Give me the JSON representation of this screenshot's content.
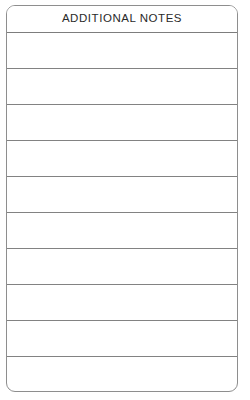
{
  "document": {
    "type": "form-section",
    "background_color": "#ffffff",
    "border_color": "#8e8e8e",
    "rule_color": "#828282",
    "text_color": "#2a2a2a"
  },
  "header": {
    "title": "ADDITIONAL NOTES"
  },
  "body": {
    "row_count": 10,
    "rows": [
      {
        "index": 1,
        "value": ""
      },
      {
        "index": 2,
        "value": ""
      },
      {
        "index": 3,
        "value": ""
      },
      {
        "index": 4,
        "value": ""
      },
      {
        "index": 5,
        "value": ""
      },
      {
        "index": 6,
        "value": ""
      },
      {
        "index": 7,
        "value": ""
      },
      {
        "index": 8,
        "value": ""
      },
      {
        "index": 9,
        "value": ""
      },
      {
        "index": 10,
        "value": ""
      }
    ]
  }
}
